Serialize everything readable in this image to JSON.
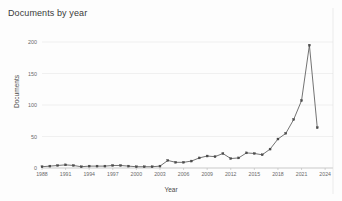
{
  "chart_data": {
    "type": "line",
    "title": "Documents by year",
    "xlabel": "Year",
    "ylabel": "Documents",
    "grid": true,
    "legend": "none",
    "xlim": [
      1988,
      2025
    ],
    "ylim": [
      0,
      200
    ],
    "yticks": [
      0,
      50,
      100,
      150,
      200
    ],
    "xticks": [
      1988,
      1991,
      1994,
      1997,
      2000,
      2003,
      2006,
      2009,
      2012,
      2015,
      2018,
      2021,
      2024
    ],
    "x": [
      1988,
      1989,
      1990,
      1991,
      1992,
      1993,
      1994,
      1995,
      1996,
      1997,
      1998,
      1999,
      2000,
      2001,
      2002,
      2003,
      2004,
      2005,
      2006,
      2007,
      2008,
      2009,
      2010,
      2011,
      2012,
      2013,
      2014,
      2015,
      2016,
      2017,
      2018,
      2019,
      2020,
      2021,
      2022,
      2023
    ],
    "values": [
      2,
      3,
      4,
      5,
      4,
      2,
      3,
      3,
      3,
      4,
      4,
      3,
      2,
      2,
      2,
      3,
      12,
      9,
      9,
      11,
      16,
      19,
      18,
      23,
      15,
      16,
      24,
      23,
      21,
      30,
      46,
      55,
      77,
      107,
      195,
      64
    ],
    "series": [
      {
        "name": "Documents",
        "color": "#4d4d4d",
        "marker": "square"
      }
    ],
    "annotations": {
      "peak_year": 2022,
      "peak_value": 195,
      "last_year": 2023,
      "last_value": 64
    }
  },
  "colors": {
    "line": "#5a5a5a",
    "marker": "#4d4d4d",
    "grid": "#e3e3e3",
    "axis": "#b9b9b9",
    "text": "#4a4a4a",
    "background": "#fdfdfd"
  }
}
